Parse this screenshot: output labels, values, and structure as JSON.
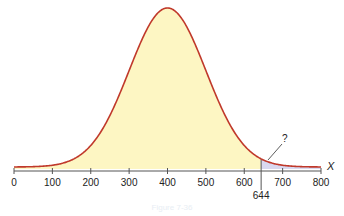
{
  "chart_data": {
    "type": "area",
    "title": "",
    "xlabel": "X",
    "ylabel": "",
    "xlim": [
      0,
      800
    ],
    "x_ticks": [
      0,
      100,
      200,
      300,
      400,
      500,
      600,
      700,
      800
    ],
    "x_tick_labels": [
      "0",
      "100",
      "200",
      "300",
      "400",
      "500",
      "600",
      "700",
      "800"
    ],
    "distribution": {
      "name": "normal",
      "mean": 400,
      "sd": 100
    },
    "shaded_regions": [
      {
        "from": 0,
        "to": 644,
        "color": "#fdf6c3",
        "label": ""
      },
      {
        "from": 644,
        "to": 800,
        "color": "#d9d8ef",
        "label": "?"
      }
    ],
    "marker": {
      "x": 644,
      "label": "644"
    },
    "annotation": "?",
    "grid": false,
    "colors": {
      "curve": "#c0392b",
      "body_fill": "#fdf6c3",
      "tail_fill": "#d9d8ef",
      "axis": "#555555"
    }
  },
  "caption": "Figure 7-36"
}
